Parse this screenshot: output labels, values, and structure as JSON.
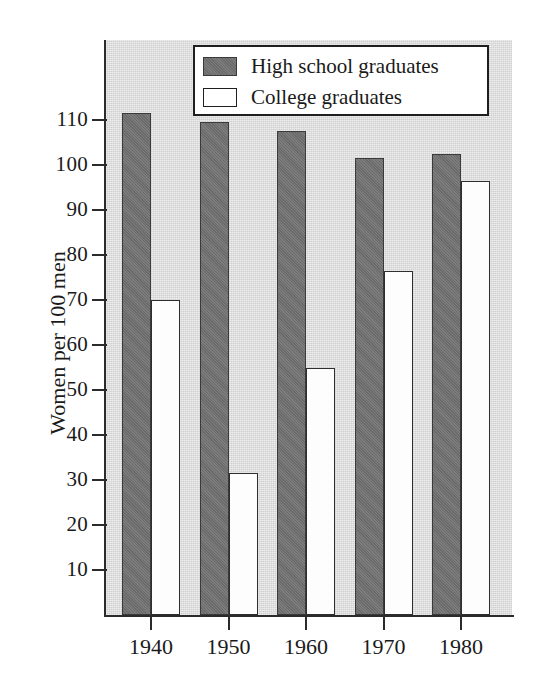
{
  "chart_data": {
    "type": "bar",
    "title": "",
    "xlabel": "",
    "ylabel": "Women per 100 men",
    "categories": [
      "1940",
      "1950",
      "1960",
      "1970",
      "1980"
    ],
    "series": [
      {
        "name": "High school graduates",
        "color": "#767676",
        "values": [
          111.5,
          109.5,
          107.5,
          101.5,
          102.5
        ]
      },
      {
        "name": "College graduates",
        "color": "#ffffff",
        "values": [
          70,
          31.5,
          55,
          76.5,
          96.5
        ]
      }
    ],
    "ylim": [
      0,
      119
    ],
    "yticks": [
      10,
      20,
      30,
      40,
      50,
      60,
      70,
      80,
      90,
      100,
      110
    ],
    "ytick_labels": [
      "10",
      "20",
      "30",
      "40",
      "50",
      "60",
      "70",
      "80",
      "90",
      "100",
      "110"
    ],
    "grid": false,
    "legend_position": "top-center",
    "legend_entries": [
      "High school graduates",
      "College graduates"
    ]
  },
  "legend": {
    "items": [
      {
        "label": "High school graduates",
        "swatch": "dark-swatch"
      },
      {
        "label": "College graduates",
        "swatch": "light-swatch"
      }
    ]
  },
  "axes": {
    "y_title": "Women per 100 men"
  }
}
